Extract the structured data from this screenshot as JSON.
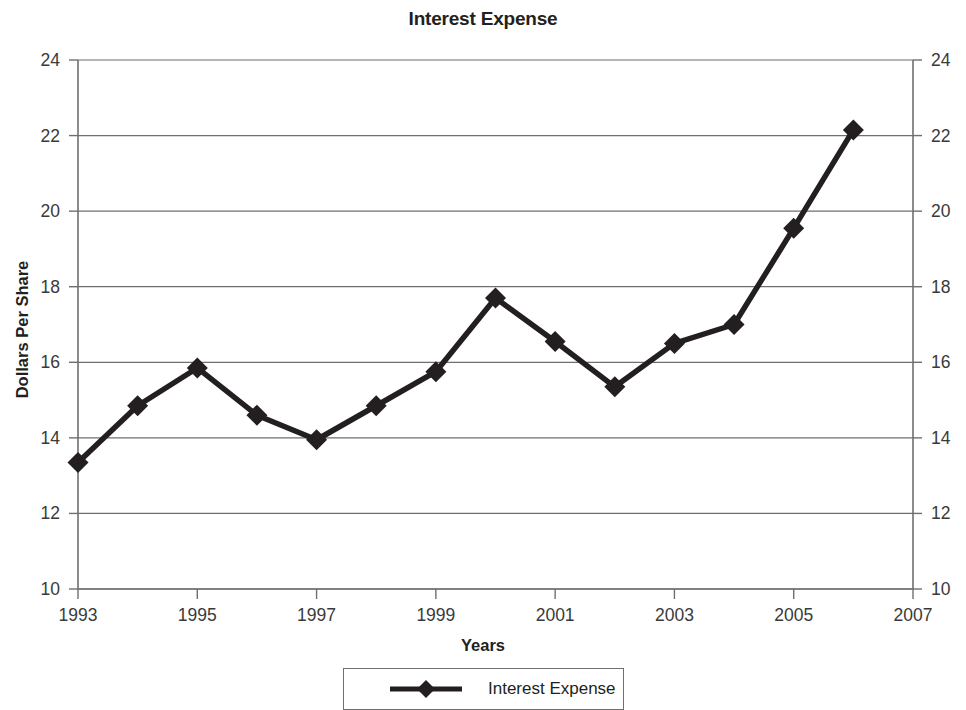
{
  "chart_data": {
    "type": "line",
    "title": "Interest Expense",
    "xlabel": "Years",
    "ylabel": "Dollars Per Share",
    "xlim": [
      1993,
      2007
    ],
    "ylim": [
      10,
      24
    ],
    "xticks": [
      1993,
      1995,
      1997,
      1999,
      2001,
      2003,
      2005,
      2007
    ],
    "xtick_labels": [
      "1993",
      "1995",
      "1997",
      "1999",
      "2001",
      "2003",
      "2005",
      "2007"
    ],
    "yticks": [
      10,
      12,
      14,
      16,
      18,
      20,
      22,
      24
    ],
    "ytick_labels": [
      "10",
      "12",
      "14",
      "16",
      "18",
      "20",
      "22",
      "24"
    ],
    "grid": "horizontal",
    "secondary_y_axis": true,
    "legend_position": "bottom",
    "marker": "diamond",
    "line_color": "#231f20",
    "x": [
      1993,
      1994,
      1995,
      1996,
      1997,
      1998,
      1999,
      2000,
      2001,
      2002,
      2003,
      2004,
      2005,
      2006
    ],
    "series": [
      {
        "name": "Interest Expense",
        "values": [
          13.35,
          14.85,
          15.85,
          14.6,
          13.95,
          14.85,
          15.75,
          17.7,
          16.55,
          15.35,
          16.5,
          17.0,
          19.55,
          22.15
        ]
      }
    ]
  },
  "legend": {
    "entries": [
      {
        "label": "Interest Expense"
      }
    ]
  }
}
